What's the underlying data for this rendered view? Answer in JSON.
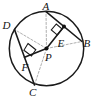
{
  "figure": {
    "canvas": {
      "width": 93,
      "height": 97
    },
    "background_color": "#ffffff",
    "stroke_color": "#1a1a1a",
    "dash_color": "#9a9a9a"
  },
  "circle": {
    "name": "circle-P",
    "center": {
      "x": 46.5,
      "y": 48.5
    },
    "radius": 37.5
  },
  "points": {
    "A": {
      "label": "A",
      "x": 46.0,
      "y": 12.0,
      "label_x": 43.0,
      "label_y": 9.5,
      "marker": false
    },
    "B": {
      "label": "B",
      "x": 81.0,
      "y": 41.0,
      "label_x": 83.0,
      "label_y": 45.0,
      "marker": false
    },
    "C": {
      "label": "C",
      "x": 35.0,
      "y": 85.0,
      "label_x": 30.0,
      "label_y": 95.0,
      "marker": false
    },
    "D": {
      "label": "D",
      "x": 15.0,
      "y": 29.0,
      "label_x": 3.0,
      "label_y": 26.0,
      "marker": false
    },
    "E": {
      "label": "E",
      "x": 63.5,
      "y": 32.0,
      "label_x": 57.0,
      "label_y": 45.0,
      "marker": true
    },
    "F": {
      "label": "F",
      "x": 29.0,
      "y": 55.5,
      "label_x": 22.0,
      "label_y": 69.0,
      "marker": false
    },
    "P": {
      "label": "P",
      "x": 46.5,
      "y": 48.5,
      "label_x": 45.0,
      "label_y": 60.0,
      "marker": true
    }
  },
  "chords": [
    {
      "name": "chord-AB",
      "from": "A",
      "to": "B",
      "label": "AB"
    },
    {
      "name": "chord-DC",
      "from": "D",
      "to": "C",
      "label": "DC"
    }
  ],
  "apothems": [
    {
      "name": "segment-PE",
      "from": "P",
      "to": "E",
      "label": "PE",
      "perpendicular_to": "AB"
    },
    {
      "name": "segment-PF",
      "from": "P",
      "to": "F",
      "label": "PF",
      "perpendicular_to": "DC"
    }
  ],
  "radii_dashed": [
    {
      "name": "radius-PA",
      "from": "P",
      "to": "A",
      "label": "PA"
    },
    {
      "name": "radius-PB",
      "from": "P",
      "to": "B",
      "label": "PB"
    },
    {
      "name": "radius-PC",
      "from": "P",
      "to": "C",
      "label": "PC"
    },
    {
      "name": "radius-PD",
      "from": "P",
      "to": "D",
      "label": "PD"
    }
  ],
  "right_angles": [
    {
      "name": "right-angle-at-E",
      "at": "E",
      "label": "90"
    },
    {
      "name": "right-angle-at-F",
      "at": "F",
      "label": "90"
    }
  ],
  "labels_order": [
    "A",
    "B",
    "C",
    "D",
    "E",
    "F",
    "P"
  ]
}
